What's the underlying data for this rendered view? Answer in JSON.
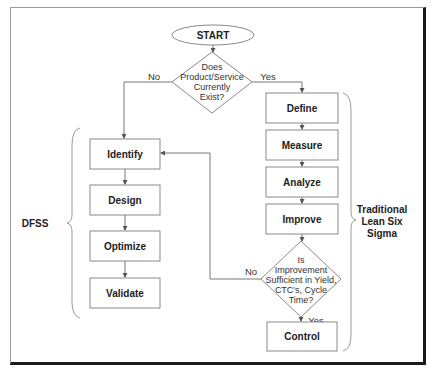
{
  "start": {
    "label": "START"
  },
  "decision1": {
    "lines": [
      "Does",
      "Product/Service",
      "Currently",
      "Exist?"
    ],
    "no_label": "No",
    "yes_label": "Yes"
  },
  "dfss": {
    "group_label": "DFSS",
    "steps": [
      "Identify",
      "Design",
      "Optimize",
      "Validate"
    ]
  },
  "lss": {
    "group_label_lines": [
      "Traditional",
      "Lean Six",
      "Sigma"
    ],
    "steps": [
      "Define",
      "Measure",
      "Analyze",
      "Improve"
    ],
    "final_step": "Control"
  },
  "decision2": {
    "lines": [
      "Is",
      "Improvement",
      "Sufficient in Yield,",
      "CTC's, Cycle",
      "Time?"
    ],
    "no_label": "No",
    "yes_label": "Yes"
  }
}
